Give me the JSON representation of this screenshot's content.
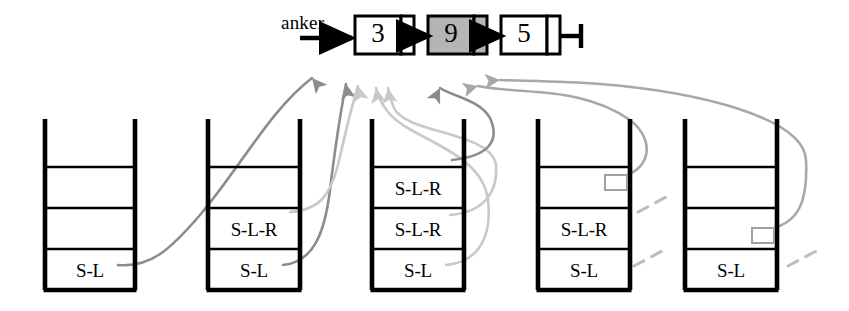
{
  "diagram": {
    "colors": {
      "ink": "#000000",
      "highlight_fill": "#b5b5b5",
      "pointer_gray_dark": "#8c8c8c",
      "pointer_gray_mid": "#a8a8a8",
      "pointer_gray_light": "#c9c9c9",
      "dash_gray": "#bdbdbd",
      "marker_stroke": "#a0a0a0",
      "paper": "#ffffff"
    },
    "anchor": {
      "label": "anker",
      "arrow_icon": "right-arrow-icon"
    },
    "list": {
      "terminator_icon": "list-end-terminator-icon",
      "nodes": [
        {
          "value": "3",
          "highlighted": false,
          "x": 355,
          "y": 16,
          "w": 46,
          "h": 38,
          "ptr_w": 13
        },
        {
          "value": "9",
          "highlighted": true,
          "x": 428,
          "y": 16,
          "w": 46,
          "h": 38,
          "ptr_w": 13
        },
        {
          "value": "5",
          "highlighted": false,
          "x": 501,
          "y": 16,
          "w": 46,
          "h": 38,
          "ptr_w": 13
        }
      ],
      "link_arrows": [
        {
          "from": 414,
          "to": 428,
          "y": 36
        },
        {
          "from": 487,
          "to": 501,
          "y": 36
        }
      ]
    },
    "stacks": [
      {
        "name": "stack-1",
        "x": 45,
        "y": 126,
        "w": 90,
        "h": 164,
        "rows": [
          "",
          "",
          "",
          "S-L"
        ],
        "markers": []
      },
      {
        "name": "stack-2",
        "x": 208,
        "y": 126,
        "w": 92,
        "h": 164,
        "rows": [
          "",
          "",
          "S-L-R",
          "S-L"
        ],
        "markers": []
      },
      {
        "name": "stack-3",
        "x": 372,
        "y": 126,
        "w": 92,
        "h": 164,
        "rows": [
          "",
          "S-L-R",
          "S-L-R",
          "S-L"
        ],
        "markers": []
      },
      {
        "name": "stack-4",
        "x": 538,
        "y": 126,
        "w": 92,
        "h": 164,
        "rows": [
          "",
          "",
          "S-L-R",
          "S-L"
        ],
        "markers": [
          {
            "row": 2,
            "x": 605,
            "y": 175,
            "w": 22,
            "h": 15
          }
        ]
      },
      {
        "name": "stack-5",
        "x": 685,
        "y": 126,
        "w": 92,
        "h": 164,
        "rows": [
          "",
          "",
          "",
          "S-L"
        ],
        "markers": [
          {
            "row": 3,
            "x": 752,
            "y": 228,
            "w": 22,
            "h": 15
          }
        ]
      }
    ],
    "pointer_arrows": [
      {
        "name": "pointer-stack1-to-node3",
        "shade": "pointer_gray_dark",
        "d": "M 118 265 C 150 268 170 250 200 215 C 240 168 270 110 312 78",
        "tip": [
          312,
          78,
          -40
        ]
      },
      {
        "name": "pointer-stack2-bottom-to-node3",
        "shade": "pointer_gray_dark",
        "d": "M 283 265 C 315 262 325 230 330 190 C 336 140 340 115 346 84",
        "tip": [
          346,
          84,
          -10
        ]
      },
      {
        "name": "pointer-stack2-mid-to-node3",
        "shade": "pointer_gray_light",
        "d": "M 290 212 C 320 210 330 195 338 165 C 346 130 352 105 358 86",
        "tip": [
          358,
          86,
          -14
        ]
      },
      {
        "name": "pointer-stack3-bottom-to-node3",
        "shade": "pointer_gray_light",
        "d": "M 446 265 C 480 262 492 235 488 200 C 482 150 410 140 388 112 C 380 102 378 95 376 88",
        "tip": [
          376,
          88,
          -10
        ]
      },
      {
        "name": "pointer-stack3-mid-to-node3",
        "shade": "pointer_gray_light",
        "d": "M 450 215 C 486 212 498 190 496 165 C 492 132 406 134 394 108 C 390 99 389 94 388 88",
        "tip": [
          388,
          88,
          -8
        ]
      },
      {
        "name": "pointer-stack3-top-to-node9",
        "shade": "pointer_gray_dark",
        "d": "M 452 160 C 490 156 500 140 490 118 C 480 100 452 96 440 88",
        "tip": [
          440,
          88,
          26
        ]
      },
      {
        "name": "pointer-stack4-to-node9",
        "shade": "pointer_gray_mid",
        "d": "M 616 178 C 652 172 656 140 630 120 C 580 85 520 95 478 86",
        "tip": [
          478,
          86,
          75
        ]
      },
      {
        "name": "pointer-stack5-long-to-node9",
        "shade": "pointer_gray_mid",
        "d": "M 763 230 C 800 226 808 200 806 160 C 804 118 700 92 600 84 C 560 81 520 81 500 80",
        "tip": [
          500,
          80,
          85
        ]
      }
    ],
    "dashed_hints": [
      {
        "name": "dash-stack4-upper",
        "x1": 638,
        "y1": 212,
        "x2": 668,
        "y2": 196
      },
      {
        "name": "dash-stack4-lower",
        "x1": 634,
        "y1": 266,
        "x2": 664,
        "y2": 250
      },
      {
        "name": "dash-stack5-lower",
        "x1": 788,
        "y1": 266,
        "x2": 822,
        "y2": 248
      }
    ]
  }
}
